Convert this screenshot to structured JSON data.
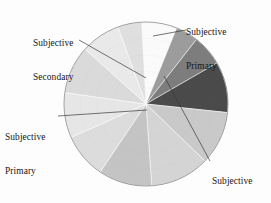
{
  "figure": {
    "kind": "pie-chart",
    "background_color": "#fdfdfd",
    "outline_color": "#8a8a8a",
    "leader_line_color": "#3a3a3a",
    "center_x": 146,
    "center_y": 104,
    "radius": 82,
    "annotations": [
      {
        "id": "subjective-primary-top",
        "line1": "Subjective",
        "line2": "Primary",
        "leader_from_x": 186,
        "leader_from_y": 30,
        "leader_to_x": 153,
        "leader_to_y": 36
      },
      {
        "id": "subjective-secondary",
        "line1": "Subjective",
        "line2": "Secondary",
        "leader_from_x": 79,
        "leader_from_y": 40,
        "leader_to_x": 146,
        "leader_to_y": 78
      },
      {
        "id": "subjective-primary-left",
        "line1": "Subjective",
        "line2": "Primary",
        "leader_from_x": 58,
        "leader_from_y": 116,
        "leader_to_x": 147,
        "leader_to_y": 110
      },
      {
        "id": "subjective-neutral",
        "line1": "Subjective",
        "line2": "Neutral",
        "leader_from_x": 210,
        "leader_from_y": 161,
        "leader_to_x": 164,
        "leader_to_y": 76
      }
    ]
  },
  "chart_data": {
    "type": "pie",
    "title": "",
    "xlabel": "",
    "ylabel": "",
    "legend_position": "none",
    "grid": false,
    "start_angle_deg": -90,
    "direction": "clockwise",
    "labels": [
      "Subjective Primary",
      "Subjective Neutral",
      "Objective A",
      "Objective B",
      "Objective C",
      "Objective D",
      "Objective E",
      "Objective F",
      "Objective G",
      "Objective H",
      "Subjective Secondary"
    ],
    "categories": [
      "Subjective Primary",
      "Subjective Neutral",
      "Objective A",
      "Objective B",
      "Objective C",
      "Objective D",
      "Objective E",
      "Objective F",
      "Objective G",
      "Objective H",
      "Subjective Secondary"
    ],
    "values": [
      7,
      12,
      11,
      14,
      13,
      10,
      9,
      8,
      7,
      5,
      4
    ],
    "colors": [
      "#fafafa",
      "#4a4a4a",
      "#c9c9c9",
      "#dedede",
      "#cfcfcf",
      "#e2e2e2",
      "#d6d6d6",
      "#ededed",
      "#e4e4e4",
      "#d0d0d0",
      "#9c9c9c"
    ],
    "slices": [
      {
        "label": "Subjective Primary",
        "value": 7,
        "start_deg": -93,
        "end_deg": -68,
        "color": "#fafafa",
        "highlight": true
      },
      {
        "label": "Subjective Secondary",
        "value": 4,
        "start_deg": -68,
        "end_deg": -52,
        "color": "#9c9c9c",
        "highlight": true
      },
      {
        "label": "Subjective Neutral A",
        "value": 6,
        "start_deg": -52,
        "end_deg": -30,
        "color": "#7d7d7d",
        "highlight": false
      },
      {
        "label": "Subjective Neutral",
        "value": 12,
        "start_deg": -30,
        "end_deg": 6,
        "color": "#4a4a4a",
        "highlight": true
      },
      {
        "label": "Objective A",
        "value": 11,
        "start_deg": 6,
        "end_deg": 44,
        "color": "#c9c9c9",
        "highlight": false
      },
      {
        "label": "Objective B",
        "value": 14,
        "start_deg": 44,
        "end_deg": 86,
        "color": "#d4d4d4",
        "highlight": false
      },
      {
        "label": "Objective C",
        "value": 13,
        "start_deg": 86,
        "end_deg": 124,
        "color": "#c4c4c4",
        "highlight": false
      },
      {
        "label": "Objective D",
        "value": 10,
        "start_deg": 124,
        "end_deg": 156,
        "color": "#dcdcdc",
        "highlight": false
      },
      {
        "label": "Objective E",
        "value": 9,
        "start_deg": 156,
        "end_deg": 188,
        "color": "#e6e6e6",
        "highlight": false
      },
      {
        "label": "Objective F",
        "value": 8,
        "start_deg": 188,
        "end_deg": 222,
        "color": "#dadada",
        "highlight": false
      },
      {
        "label": "Objective G",
        "value": 7,
        "start_deg": 222,
        "end_deg": 250,
        "color": "#e9e9e9",
        "highlight": false
      },
      {
        "label": "Objective H",
        "value": 5,
        "start_deg": 250,
        "end_deg": 267,
        "color": "#dfdfdf",
        "highlight": false
      }
    ]
  }
}
